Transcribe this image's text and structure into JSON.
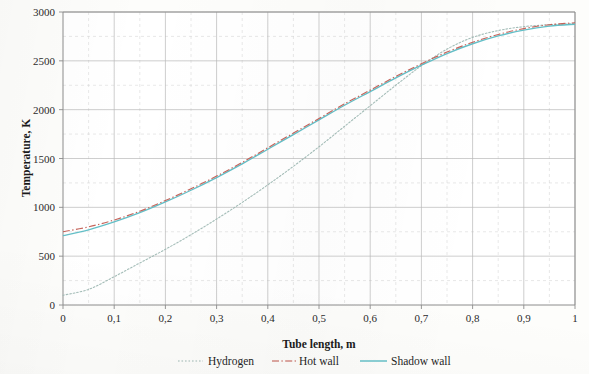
{
  "chart_data": {
    "type": "line",
    "title": "",
    "xlabel": "Tube length, m",
    "ylabel": "Temperature, K",
    "xlim": [
      0,
      1
    ],
    "ylim": [
      0,
      3000
    ],
    "x_tick_labels": [
      "0",
      "0,1",
      "0,2",
      "0,3",
      "0,4",
      "0,5",
      "0,6",
      "0,7",
      "0,8",
      "0,9",
      "1"
    ],
    "x_ticks": [
      0,
      0.1,
      0.2,
      0.3,
      0.4,
      0.5,
      0.6,
      0.7,
      0.8,
      0.9,
      1
    ],
    "y_tick_labels": [
      "0",
      "500",
      "1000",
      "1500",
      "2000",
      "2500",
      "3000"
    ],
    "y_ticks": [
      0,
      500,
      1000,
      1500,
      2000,
      2500,
      3000
    ],
    "grid": true,
    "grid_minor_step_y": 250,
    "grid_minor_step_x": 0.05,
    "legend_position": "bottom",
    "x": [
      0,
      0.05,
      0.1,
      0.15,
      0.2,
      0.25,
      0.3,
      0.35,
      0.4,
      0.45,
      0.5,
      0.55,
      0.6,
      0.65,
      0.7,
      0.75,
      0.8,
      0.85,
      0.9,
      0.95,
      1
    ],
    "series": [
      {
        "name": "Hydrogen",
        "color": "#9fb9b4",
        "style": "dotted",
        "values": [
          100,
          160,
          290,
          430,
          570,
          720,
          880,
          1050,
          1230,
          1420,
          1620,
          1830,
          2040,
          2250,
          2450,
          2620,
          2740,
          2810,
          2850,
          2870,
          2880
        ]
      },
      {
        "name": "Hot wall",
        "color": "#c0544a",
        "style": "dash-dot",
        "values": [
          750,
          800,
          870,
          960,
          1070,
          1190,
          1320,
          1460,
          1610,
          1760,
          1910,
          2060,
          2200,
          2340,
          2470,
          2590,
          2690,
          2770,
          2830,
          2870,
          2890
        ]
      },
      {
        "name": "Shadow wall",
        "color": "#5bbcc4",
        "style": "solid",
        "values": [
          710,
          770,
          850,
          945,
          1055,
          1175,
          1305,
          1445,
          1595,
          1745,
          1895,
          2045,
          2185,
          2325,
          2455,
          2575,
          2675,
          2755,
          2815,
          2855,
          2875
        ]
      }
    ]
  },
  "legend": {
    "items": [
      {
        "label": "Hydrogen"
      },
      {
        "label": "Hot wall"
      },
      {
        "label": "Shadow wall"
      }
    ]
  }
}
